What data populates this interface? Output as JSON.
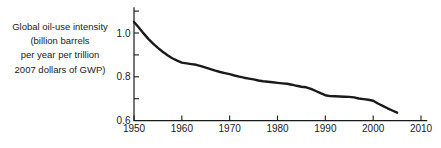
{
  "figure": {
    "background": "#ffffff",
    "line_color": "#1a1a1a",
    "axis_color": "#1a1a1a",
    "text_color": "#1a1a1a"
  },
  "chart_data": {
    "type": "line",
    "title": "",
    "xlabel": "",
    "ylabel": "Global oil-use intensity (billion barrels per year per trillion 2007 dollars of GWP)",
    "ylabel_lines": [
      "Global oil-use intensity",
      "(billion barrels",
      "per year per trillion",
      "2007 dollars of GWP)"
    ],
    "xlim": [
      1950,
      2011.3
    ],
    "ylim": [
      0.6,
      1.118
    ],
    "x_ticks": [
      1950,
      1960,
      1970,
      1980,
      1990,
      2000,
      2010
    ],
    "y_tick_labels": [
      "0.6",
      "0.8",
      "1.0"
    ],
    "y_tick_label_values": [
      0.6,
      0.8,
      1.0
    ],
    "y_ticks_marked": [
      0.7,
      0.8,
      0.9,
      1.0,
      1.1
    ],
    "grid": false,
    "legend": false,
    "series": [
      {
        "name": "Global oil-use intensity",
        "x": [
          1950,
          1951,
          1952,
          1953,
          1954,
          1955,
          1956,
          1957,
          1958,
          1959,
          1960,
          1961,
          1962,
          1963,
          1964,
          1965,
          1966,
          1967,
          1968,
          1969,
          1970,
          1971,
          1972,
          1973,
          1974,
          1975,
          1976,
          1977,
          1978,
          1979,
          1980,
          1981,
          1982,
          1983,
          1984,
          1985,
          1986,
          1987,
          1988,
          1989,
          1990,
          1991,
          1992,
          1993,
          1994,
          1995,
          1996,
          1997,
          1998,
          1999,
          2000,
          2001,
          2002,
          2003,
          2004,
          2005
        ],
        "y": [
          1.05,
          1.025,
          0.998,
          0.973,
          0.951,
          0.932,
          0.914,
          0.898,
          0.885,
          0.874,
          0.865,
          0.861,
          0.858,
          0.855,
          0.849,
          0.842,
          0.835,
          0.828,
          0.822,
          0.817,
          0.812,
          0.806,
          0.801,
          0.796,
          0.792,
          0.788,
          0.783,
          0.78,
          0.777,
          0.775,
          0.772,
          0.77,
          0.768,
          0.764,
          0.759,
          0.755,
          0.752,
          0.745,
          0.735,
          0.725,
          0.716,
          0.712,
          0.711,
          0.71,
          0.709,
          0.708,
          0.706,
          0.701,
          0.698,
          0.695,
          0.691,
          0.678,
          0.667,
          0.656,
          0.646,
          0.636
        ]
      }
    ]
  }
}
